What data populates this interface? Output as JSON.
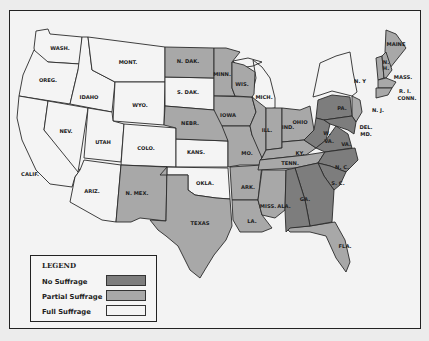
{
  "legend": {
    "title": "LEGEND",
    "items": [
      {
        "label": "No Suffrage",
        "color": "#7d7d7d"
      },
      {
        "label": "Partial Suffrage",
        "color": "#a8a8a8"
      },
      {
        "label": "Full Suffrage",
        "color": "#f4f4f4"
      }
    ]
  },
  "states": [
    {
      "name": "WASH.",
      "status": "full"
    },
    {
      "name": "OREG.",
      "status": "full"
    },
    {
      "name": "CALIF.",
      "status": "full"
    },
    {
      "name": "IDAHO",
      "status": "full"
    },
    {
      "name": "NEV.",
      "status": "full"
    },
    {
      "name": "MONT.",
      "status": "full"
    },
    {
      "name": "WYO.",
      "status": "full"
    },
    {
      "name": "UTAH",
      "status": "full"
    },
    {
      "name": "COLO.",
      "status": "full"
    },
    {
      "name": "ARIZ.",
      "status": "full"
    },
    {
      "name": "N. MEX.",
      "status": "partial"
    },
    {
      "name": "N. DAK.",
      "status": "partial"
    },
    {
      "name": "S. DAK.",
      "status": "full"
    },
    {
      "name": "NEBR.",
      "status": "partial"
    },
    {
      "name": "KANS.",
      "status": "full"
    },
    {
      "name": "OKLA.",
      "status": "full"
    },
    {
      "name": "TEXAS",
      "status": "partial"
    },
    {
      "name": "MINN.",
      "status": "partial"
    },
    {
      "name": "IOWA",
      "status": "partial"
    },
    {
      "name": "MO.",
      "status": "partial"
    },
    {
      "name": "ARK.",
      "status": "partial"
    },
    {
      "name": "LA.",
      "status": "partial"
    },
    {
      "name": "WIS.",
      "status": "partial"
    },
    {
      "name": "ILL.",
      "status": "partial"
    },
    {
      "name": "MICH.",
      "status": "full"
    },
    {
      "name": "IND.",
      "status": "partial"
    },
    {
      "name": "OHIO",
      "status": "partial"
    },
    {
      "name": "KY.",
      "status": "partial"
    },
    {
      "name": "TENN.",
      "status": "partial"
    },
    {
      "name": "MISS.",
      "status": "partial"
    },
    {
      "name": "ALA.",
      "status": "none"
    },
    {
      "name": "GA.",
      "status": "none"
    },
    {
      "name": "FLA.",
      "status": "partial"
    },
    {
      "name": "S. C.",
      "status": "none"
    },
    {
      "name": "N. C.",
      "status": "none"
    },
    {
      "name": "VA.",
      "status": "none"
    },
    {
      "name": "W. VA.",
      "status": "none"
    },
    {
      "name": "PA.",
      "status": "none"
    },
    {
      "name": "N. Y",
      "status": "full"
    },
    {
      "name": "N. J.",
      "status": "partial"
    },
    {
      "name": "DEL.",
      "status": "none"
    },
    {
      "name": "MD.",
      "status": "none"
    },
    {
      "name": "MAINE",
      "status": "partial"
    },
    {
      "name": "N. H.",
      "status": "partial"
    },
    {
      "name": "VT.",
      "status": "partial"
    },
    {
      "name": "MASS.",
      "status": "partial"
    },
    {
      "name": "R. I.",
      "status": "partial"
    },
    {
      "name": "CONN.",
      "status": "partial"
    }
  ]
}
